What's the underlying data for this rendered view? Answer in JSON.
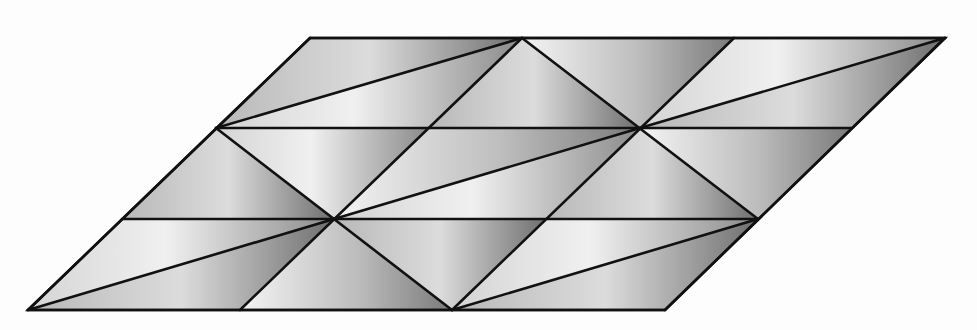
{
  "diagram": {
    "title": "",
    "colors": {
      "background": "#fdfdfd",
      "stroke": "#111111",
      "shade_light": "#f2f2f2",
      "shade_mid": "#bdbdbd",
      "shade_dark": "#6e6e6e"
    },
    "stroke_width": 2.6,
    "lattice": {
      "rows_y": [
        310,
        219,
        128,
        38
      ],
      "origin_x": 28,
      "row_shift_x": 94,
      "col_step_x": 212,
      "columns": 4
    },
    "outline": {
      "points": [
        [
          28,
          310
        ],
        [
          665,
          310
        ],
        [
          945,
          38
        ],
        [
          310,
          38
        ]
      ]
    },
    "horizontal_lines": [
      {
        "from": [
          28,
          310
        ],
        "to": [
          665,
          310
        ]
      },
      {
        "from": [
          122,
          219
        ],
        "to": [
          758,
          219
        ]
      },
      {
        "from": [
          216,
          128
        ],
        "to": [
          852,
          128
        ]
      },
      {
        "from": [
          310,
          38
        ],
        "to": [
          945,
          38
        ]
      }
    ],
    "slanted_lines": [
      {
        "from": [
          28,
          310
        ],
        "to": [
          310,
          38
        ]
      },
      {
        "from": [
          240,
          310
        ],
        "to": [
          522,
          38
        ]
      },
      {
        "from": [
          452,
          310
        ],
        "to": [
          734,
          38
        ]
      },
      {
        "from": [
          665,
          310
        ],
        "to": [
          945,
          38
        ]
      }
    ],
    "descending_lines": [
      {
        "from": [
          216,
          128
        ],
        "to": [
          452,
          310
        ]
      },
      {
        "from": [
          522,
          38
        ],
        "to": [
          758,
          219
        ]
      }
    ],
    "long_diagonals": [
      {
        "from": [
          28,
          310
        ],
        "to": [
          334,
          219
        ]
      },
      {
        "from": [
          216,
          128
        ],
        "to": [
          522,
          38
        ]
      },
      {
        "from": [
          334,
          219
        ],
        "to": [
          640,
          128
        ]
      },
      {
        "from": [
          452,
          310
        ],
        "to": [
          758,
          219
        ]
      },
      {
        "from": [
          640,
          128
        ],
        "to": [
          945,
          38
        ]
      }
    ],
    "triangles": [
      {
        "pts": [
          [
            28,
            310
          ],
          [
            240,
            310
          ],
          [
            334,
            219
          ]
        ],
        "shade": "g2"
      },
      {
        "pts": [
          [
            28,
            310
          ],
          [
            334,
            219
          ],
          [
            122,
            219
          ]
        ],
        "shade": "g1"
      },
      {
        "pts": [
          [
            240,
            310
          ],
          [
            452,
            310
          ],
          [
            334,
            219
          ]
        ],
        "shade": "g3"
      },
      {
        "pts": [
          [
            334,
            219
          ],
          [
            452,
            310
          ],
          [
            546,
            219
          ]
        ],
        "shade": "g2"
      },
      {
        "pts": [
          [
            452,
            310
          ],
          [
            758,
            219
          ],
          [
            546,
            219
          ]
        ],
        "shade": "g1"
      },
      {
        "pts": [
          [
            452,
            310
          ],
          [
            665,
            310
          ],
          [
            758,
            219
          ]
        ],
        "shade": "g2"
      },
      {
        "pts": [
          [
            122,
            219
          ],
          [
            334,
            219
          ],
          [
            216,
            128
          ]
        ],
        "shade": "g2"
      },
      {
        "pts": [
          [
            216,
            128
          ],
          [
            334,
            219
          ],
          [
            428,
            128
          ]
        ],
        "shade": "g1"
      },
      {
        "pts": [
          [
            334,
            219
          ],
          [
            640,
            128
          ],
          [
            428,
            128
          ]
        ],
        "shade": "g3"
      },
      {
        "pts": [
          [
            334,
            219
          ],
          [
            546,
            219
          ],
          [
            640,
            128
          ]
        ],
        "shade": "g1"
      },
      {
        "pts": [
          [
            546,
            219
          ],
          [
            758,
            219
          ],
          [
            640,
            128
          ]
        ],
        "shade": "g2"
      },
      {
        "pts": [
          [
            640,
            128
          ],
          [
            758,
            219
          ],
          [
            852,
            128
          ]
        ],
        "shade": "g3"
      },
      {
        "pts": [
          [
            216,
            128
          ],
          [
            428,
            128
          ],
          [
            522,
            38
          ]
        ],
        "shade": "g1"
      },
      {
        "pts": [
          [
            216,
            128
          ],
          [
            522,
            38
          ],
          [
            310,
            38
          ]
        ],
        "shade": "g2"
      },
      {
        "pts": [
          [
            428,
            128
          ],
          [
            640,
            128
          ],
          [
            522,
            38
          ]
        ],
        "shade": "g2"
      },
      {
        "pts": [
          [
            522,
            38
          ],
          [
            640,
            128
          ],
          [
            734,
            38
          ]
        ],
        "shade": "g3"
      },
      {
        "pts": [
          [
            640,
            128
          ],
          [
            945,
            38
          ],
          [
            734,
            38
          ]
        ],
        "shade": "g1"
      },
      {
        "pts": [
          [
            640,
            128
          ],
          [
            852,
            128
          ],
          [
            945,
            38
          ]
        ],
        "shade": "g2"
      }
    ]
  }
}
